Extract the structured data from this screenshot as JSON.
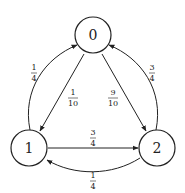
{
  "diagram": {
    "type": "markov-chain",
    "nodes": [
      {
        "id": "0",
        "label": "0"
      },
      {
        "id": "1",
        "label": "1"
      },
      {
        "id": "2",
        "label": "2"
      }
    ],
    "edges": [
      {
        "from": "1",
        "to": "0",
        "num": "1",
        "den": "4"
      },
      {
        "from": "0",
        "to": "1",
        "num": "1",
        "den": "10"
      },
      {
        "from": "0",
        "to": "2",
        "num": "9",
        "den": "10"
      },
      {
        "from": "2",
        "to": "0",
        "num": "3",
        "den": "4"
      },
      {
        "from": "1",
        "to": "2",
        "num": "3",
        "den": "4"
      },
      {
        "from": "2",
        "to": "1",
        "num": "1",
        "den": "4"
      }
    ]
  }
}
